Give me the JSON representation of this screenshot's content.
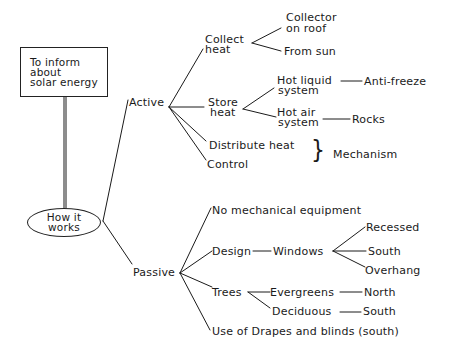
{
  "goal": {
    "line1": "To inform",
    "line2": "about",
    "line3": "solar energy"
  },
  "root": {
    "line1": "How it",
    "line2": "works"
  },
  "branches": {
    "active": {
      "label": "Active",
      "collect_heat": {
        "line1": "Collect",
        "line2": "heat",
        "children": {
          "collector_line1": "Collector",
          "collector_line2": "on roof",
          "from_sun": "From sun"
        }
      },
      "store_heat": {
        "line1": "Store",
        "line2": "heat",
        "hot_liquid": {
          "line1": "Hot liquid",
          "line2": "system",
          "child": "Anti-freeze"
        },
        "hot_air": {
          "line1": "Hot air",
          "line2": "system",
          "child": "Rocks"
        }
      },
      "distribute_heat": "Distribute heat",
      "control": "Control",
      "mechanism": "Mechanism",
      "brace": "}"
    },
    "passive": {
      "label": "Passive",
      "no_mechanical": "No mechanical equipment",
      "design": {
        "label": "Design",
        "windows": {
          "label": "Windows",
          "children": [
            "Recessed",
            "South",
            "Overhang"
          ]
        }
      },
      "trees": {
        "label": "Trees",
        "evergreens": {
          "label": "Evergreens",
          "child": "North"
        },
        "deciduous": {
          "label": "Deciduous",
          "child": "South"
        }
      },
      "drapes": "Use of Drapes and blinds (south)"
    }
  }
}
